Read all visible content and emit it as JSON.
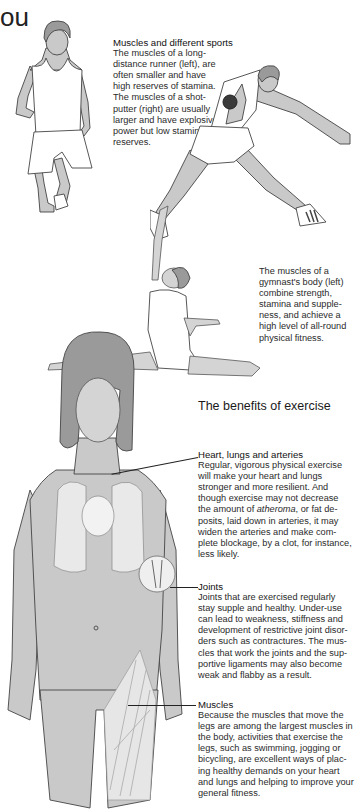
{
  "page": {
    "heading_fragment": "ou"
  },
  "sports": {
    "title": "Muscles and different sports",
    "lines": [
      "The muscles of a long-",
      "distance runner (left), are",
      "often smaller and have",
      "high reserves of stamina.",
      "The muscles of a shot-",
      "putter (right) are usually",
      "larger and have explosive",
      "power but low stamina",
      "reserves."
    ]
  },
  "gymnast": {
    "lines": [
      "The muscles of a",
      "gymnast's body (left)",
      "combine strength,",
      "stamina and supple-",
      "ness, and achieve a",
      "high level of all-round",
      "physical fitness."
    ]
  },
  "benefits": {
    "title": "The benefits of exercise",
    "heart": {
      "title": "Heart, lungs and arteries",
      "lines": [
        "Regular, vigorous physical exercise",
        "will make your heart and lungs",
        "stronger and more resilient. And",
        "though exercise may not decrease",
        "the amount of |atheroma|, or fat de-",
        "posits, laid down in arteries, it may",
        "widen the arteries and make com-",
        "plete blockage, by a clot, for instance,",
        "less likely."
      ],
      "line5_pre": "the amount of ",
      "line5_italic": "atheroma",
      "line5_post": ", or fat de-"
    },
    "joints": {
      "title": "Joints",
      "lines": [
        "Joints that are exercised regularly",
        "stay supple and healthy. Under-use",
        "can lead to weakness, stiffness and",
        "development of restrictive joint disor-",
        "ders such as contractures. The mus-",
        "cles that work the joints and the sup-",
        "portive ligaments may also become",
        "weak and flabby as a result."
      ]
    },
    "muscles": {
      "title": "Muscles",
      "lines": [
        "Because the muscles that move the",
        "legs are among the largest muscles in",
        "the body, activities that exercise the",
        "legs, such as swimming, jogging or",
        "bicycling, are excellent ways of plac-",
        "ing healthy demands on your heart",
        "and lungs and helping to improve your",
        "general fitness."
      ]
    }
  },
  "illustrations": [
    {
      "name": "long-distance-runner"
    },
    {
      "name": "shot-putter"
    },
    {
      "name": "gymnast"
    },
    {
      "name": "female-anatomy-figure"
    }
  ],
  "colors": {
    "skin": "#c9c9c9",
    "hair": "#9a9a9a",
    "text": "#1e1e1e",
    "background": "#ffffff"
  }
}
